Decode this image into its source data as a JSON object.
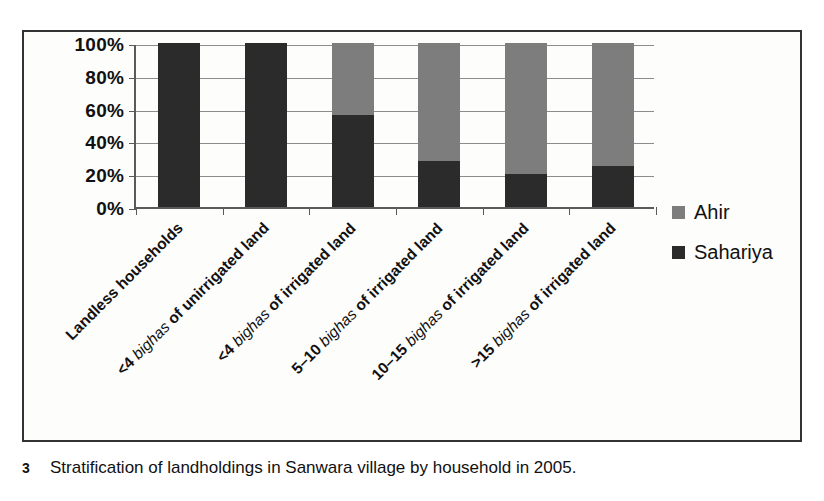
{
  "figure": {
    "caption_number": "3",
    "caption_text": "Stratification of landholdings in Sanwara village by household in 2005."
  },
  "legend": {
    "position": "right",
    "items": [
      {
        "label": "Ahir",
        "color": "#7d7d7d",
        "swatch_name": "ahir-swatch"
      },
      {
        "label": "Sahariya",
        "color": "#2b2b2b",
        "swatch_name": "sahariya-swatch"
      }
    ]
  },
  "axis": {
    "y_ticks": [
      "100%",
      "80%",
      "60%",
      "40%",
      "20%",
      "0%"
    ],
    "x_labels": [
      "Landless households",
      "<4 bighas of unirrigated land",
      "<4 bighas of irrigated land",
      "5–10 bighas of irrigated land",
      "10–15 bighas of irrigated land",
      ">15 bighas of irrigated land"
    ]
  },
  "chart_data": {
    "type": "bar",
    "stacked": true,
    "normalized": true,
    "title": "",
    "xlabel": "",
    "ylabel": "",
    "ylim": [
      0,
      100
    ],
    "ytick_values": [
      0,
      20,
      40,
      60,
      80,
      100
    ],
    "grid": true,
    "legend_position": "right",
    "categories": [
      "Landless households",
      "<4 bighas of unirrigated land",
      "<4 bighas of irrigated land",
      "5–10 bighas of irrigated land",
      "10–15 bighas of irrigated land",
      ">15 bighas of irrigated land"
    ],
    "series": [
      {
        "name": "Sahariya",
        "color": "#2b2b2b",
        "values": [
          100,
          100,
          56,
          28,
          20,
          25
        ]
      },
      {
        "name": "Ahir",
        "color": "#7d7d7d",
        "values": [
          0,
          0,
          44,
          72,
          80,
          75
        ]
      }
    ]
  }
}
